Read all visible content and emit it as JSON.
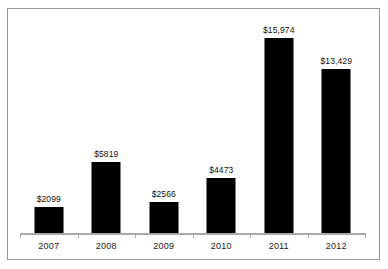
{
  "chart_data": {
    "type": "bar",
    "title": "",
    "subtitle": "",
    "xlabel": "",
    "ylabel": "",
    "categories": [
      "2007",
      "2008",
      "2009",
      "2010",
      "2011",
      "2012"
    ],
    "values": [
      2099,
      5819,
      2566,
      4473,
      15974,
      13429
    ],
    "value_labels": [
      "$2099",
      "$5819",
      "$2566",
      "$4473",
      "$15,974",
      "$13,429"
    ],
    "ylim": [
      0,
      15974
    ],
    "grid": false,
    "legend": null,
    "series": [
      {
        "name": "",
        "values": [
          2099,
          5819,
          2566,
          4473,
          15974,
          13429
        ]
      }
    ],
    "colors": {
      "bar": "#000000",
      "axis": "#a8a8a8",
      "border": "#9a9a9a",
      "label_text": "#101010",
      "background": "#ffffff"
    }
  }
}
